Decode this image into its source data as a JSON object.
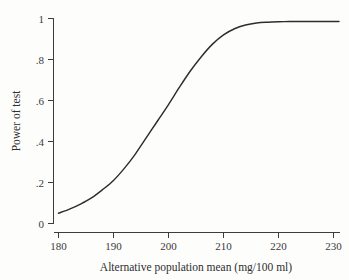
{
  "chart_data": {
    "type": "line",
    "title": "",
    "subtitle": "",
    "xlabel": "Alternative population mean (mg/100 ml)",
    "ylabel": "Power of test",
    "xlim": [
      178,
      233
    ],
    "ylim": [
      0,
      1.02
    ],
    "xticks": [
      180,
      190,
      200,
      210,
      220,
      230
    ],
    "xtick_labels": [
      "180",
      "190",
      "200",
      "210",
      "220",
      "230"
    ],
    "yticks": [
      0,
      0.2,
      0.4,
      0.6,
      0.8,
      1
    ],
    "ytick_labels": [
      "0",
      ".2",
      ".4",
      ".6",
      ".8",
      "1"
    ],
    "grid": false,
    "legend": null,
    "legend_position": "none",
    "annotations": [],
    "series": [
      {
        "name": "Power curve",
        "color": "#2d2d2d",
        "x": [
          180,
          182,
          184,
          186,
          188,
          190,
          192,
          194,
          196,
          198,
          200,
          202,
          204,
          206,
          208,
          210,
          212,
          214,
          216,
          218,
          220,
          222,
          224,
          226,
          228,
          230,
          231
        ],
        "values": [
          0.05,
          0.07,
          0.095,
          0.125,
          0.165,
          0.21,
          0.27,
          0.34,
          0.42,
          0.5,
          0.58,
          0.665,
          0.745,
          0.815,
          0.875,
          0.92,
          0.95,
          0.968,
          0.978,
          0.982,
          0.984,
          0.985,
          0.985,
          0.985,
          0.985,
          0.985,
          0.985
        ]
      }
    ]
  },
  "axes": {
    "x_title": "Alternative population mean (mg/100 ml)",
    "y_title": "Power of test"
  }
}
